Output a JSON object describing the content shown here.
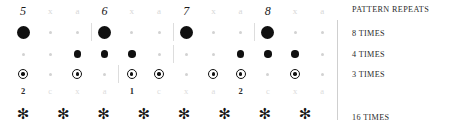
{
  "figure": {
    "columns": 12,
    "colors": {
      "ink": "#101010",
      "faint": "#d7d7d7",
      "rule": "#cfcfcf"
    }
  },
  "header_row": {
    "name": "measure-numbers",
    "cells": [
      {
        "text": "5",
        "emphasis": "strong"
      },
      {
        "text": "x",
        "emphasis": "faint"
      },
      {
        "text": "a",
        "emphasis": "faint"
      },
      {
        "text": "6",
        "emphasis": "strong"
      },
      {
        "text": "x",
        "emphasis": "faint"
      },
      {
        "text": "a",
        "emphasis": "faint"
      },
      {
        "text": "7",
        "emphasis": "strong"
      },
      {
        "text": "x",
        "emphasis": "faint"
      },
      {
        "text": "a",
        "emphasis": "faint"
      },
      {
        "text": "8",
        "emphasis": "strong"
      },
      {
        "text": "x",
        "emphasis": "faint"
      },
      {
        "text": "a",
        "emphasis": "faint"
      }
    ]
  },
  "pattern_rows": [
    {
      "name": "row-8-times",
      "label": "8 TIMES",
      "top": 22,
      "marks": [
        "large",
        "small",
        "small",
        "large",
        "small",
        "small",
        "large",
        "small",
        "small",
        "large",
        "small",
        "small"
      ],
      "ticks": [
        3,
        6,
        9
      ]
    },
    {
      "name": "row-4-times",
      "label": "4 TIMES",
      "top": 44,
      "marks": [
        "small",
        "small",
        "medium",
        "medium",
        "medium",
        "small",
        "small",
        "small",
        "medium",
        "medium",
        "medium",
        "small"
      ],
      "ticks": [
        6
      ]
    },
    {
      "name": "row-3-times",
      "label": "3 TIMES",
      "top": 64,
      "marks": [
        "ring",
        "small",
        "ring",
        "small",
        "ring",
        "ring",
        "small",
        "ring",
        "ring",
        "small",
        "ring",
        "small"
      ],
      "ticks": [
        4
      ]
    }
  ],
  "mini_row": {
    "name": "beat-subdivision-numbers",
    "cells": [
      {
        "text": "2",
        "emphasis": "strong"
      },
      {
        "text": "c",
        "emphasis": "faint"
      },
      {
        "text": "x",
        "emphasis": "faint"
      },
      {
        "text": "a",
        "emphasis": "faint"
      },
      {
        "text": "1",
        "emphasis": "strong"
      },
      {
        "text": "c",
        "emphasis": "faint"
      },
      {
        "text": "x",
        "emphasis": "faint"
      },
      {
        "text": "a",
        "emphasis": "faint"
      },
      {
        "text": "2",
        "emphasis": "strong"
      },
      {
        "text": "c",
        "emphasis": "faint"
      },
      {
        "text": "x",
        "emphasis": "faint"
      },
      {
        "text": "a",
        "emphasis": "faint"
      }
    ]
  },
  "asterisk_row": {
    "name": "row-16-times",
    "label": "16 TIMES",
    "glyph": "✻",
    "count": 8,
    "top": 104
  },
  "legend": {
    "heading": "PATTERN REPEATS",
    "items": [
      {
        "label": "PATTERN REPEATS",
        "top": 6
      },
      {
        "label": "8 TIMES",
        "top": 30
      },
      {
        "label": "4 TIMES",
        "top": 51
      },
      {
        "label": "3 TIMES",
        "top": 71
      },
      {
        "label": "16 TIMES",
        "top": 114
      }
    ]
  }
}
